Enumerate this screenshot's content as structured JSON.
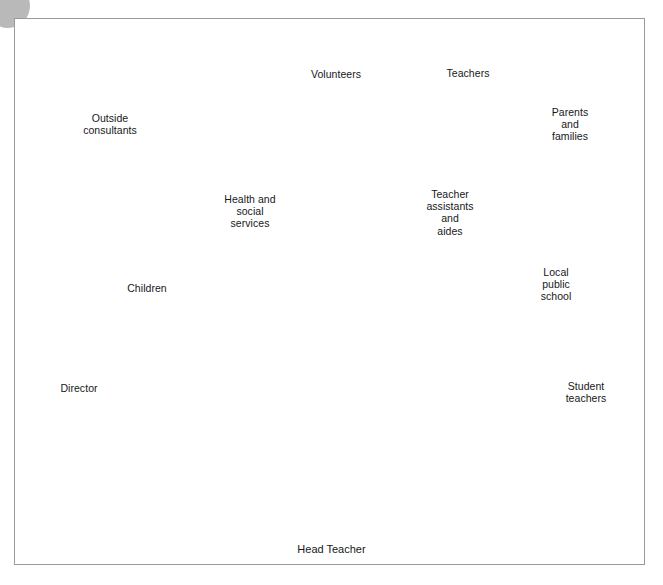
{
  "figure": {
    "type": "radial-balloon-diagram",
    "caption": "Head Teacher",
    "center_label": "Head Teacher",
    "center_icon": "head-teacher-portrait",
    "colors": {
      "balloon_fill": "#8a8a8a",
      "balloon_outline": "#4d4d4d",
      "balloon_highlight": "#e6e6e6",
      "string": "#8d8d8d",
      "frame_border": "#9a9a9a",
      "background": "#ffffff",
      "text": "#16181a",
      "corner_marker": "#b9b9b9",
      "skin": "#d4d4d4",
      "hair": "#1a1a1a"
    },
    "corner_marker": "page-corner-circle"
  },
  "balloons": [
    {
      "id": "outside-consultants",
      "label": "Outside\nconsultants",
      "cx": 110,
      "cy": 127,
      "rx": 46,
      "ry": 52,
      "rotate": -10,
      "highlight": "left",
      "knot_x": 122,
      "knot_y": 180,
      "label_x": 110,
      "label_y": 124
    },
    {
      "id": "volunteers",
      "label": "Volunteers",
      "cx": 336,
      "cy": 77,
      "rx": 43,
      "ry": 51,
      "rotate": 0,
      "highlight": "left",
      "knot_x": 336,
      "knot_y": 129,
      "label_x": 336,
      "label_y": 74
    },
    {
      "id": "teachers",
      "label": "Teachers",
      "cx": 470,
      "cy": 73,
      "rx": 45,
      "ry": 51,
      "rotate": 8,
      "highlight": "right",
      "knot_x": 452,
      "knot_y": 122,
      "label_x": 468,
      "label_y": 73
    },
    {
      "id": "parents-and-families",
      "label": "Parents\nand\nfamilies",
      "cx": 572,
      "cy": 127,
      "rx": 45,
      "ry": 51,
      "rotate": 10,
      "highlight": "right",
      "knot_x": 556,
      "knot_y": 175,
      "label_x": 570,
      "label_y": 124
    },
    {
      "id": "health-and-social-services",
      "label": "Health and\nsocial\nservices",
      "cx": 251,
      "cy": 213,
      "rx": 44,
      "ry": 50,
      "rotate": -6,
      "highlight": "left",
      "knot_x": 265,
      "knot_y": 262,
      "label_x": 250,
      "label_y": 211
    },
    {
      "id": "teacher-assistants-and-aides",
      "label": "Teacher\nassistants\nand\naides",
      "cx": 452,
      "cy": 212,
      "rx": 44,
      "ry": 50,
      "rotate": 6,
      "highlight": "right",
      "knot_x": 437,
      "knot_y": 260,
      "label_x": 450,
      "label_y": 212
    },
    {
      "id": "children",
      "label": "Children",
      "cx": 146,
      "cy": 291,
      "rx": 47,
      "ry": 50,
      "rotate": -14,
      "highlight": "left",
      "knot_x": 166,
      "knot_y": 335,
      "label_x": 147,
      "label_y": 288
    },
    {
      "id": "local-public-school",
      "label": "Local\npublic\nschool",
      "cx": 558,
      "cy": 285,
      "rx": 44,
      "ry": 50,
      "rotate": 10,
      "highlight": "right",
      "knot_x": 541,
      "knot_y": 332,
      "label_x": 556,
      "label_y": 284
    },
    {
      "id": "director",
      "label": "Director",
      "cx": 77,
      "cy": 392,
      "rx": 49,
      "ry": 50,
      "rotate": -18,
      "highlight": "left",
      "knot_x": 104,
      "knot_y": 431,
      "label_x": 79,
      "label_y": 388
    },
    {
      "id": "student-teachers",
      "label": "Student\nteachers",
      "cx": 587,
      "cy": 394,
      "rx": 46,
      "ry": 50,
      "rotate": 12,
      "highlight": "right",
      "knot_x": 568,
      "knot_y": 437,
      "label_x": 586,
      "label_y": 392
    }
  ],
  "connectors": [
    {
      "id": "connector-outside-consultants",
      "from": "head-teacher",
      "to": "outside-consultants"
    },
    {
      "id": "connector-volunteers",
      "from": "head-teacher",
      "to": "volunteers"
    },
    {
      "id": "connector-teachers",
      "from": "head-teacher",
      "to": "teachers"
    },
    {
      "id": "connector-parents-and-families",
      "from": "head-teacher",
      "to": "parents-and-families"
    },
    {
      "id": "connector-health-and-social-services",
      "from": "head-teacher",
      "to": "health-and-social-services"
    },
    {
      "id": "connector-teacher-assistants-and-aides",
      "from": "head-teacher",
      "to": "teacher-assistants-and-aides"
    },
    {
      "id": "connector-children",
      "from": "head-teacher",
      "to": "children"
    },
    {
      "id": "connector-local-public-school",
      "from": "head-teacher",
      "to": "local-public-school"
    },
    {
      "id": "connector-director",
      "from": "head-teacher",
      "to": "director"
    },
    {
      "id": "connector-student-teachers",
      "from": "head-teacher",
      "to": "student-teachers"
    }
  ]
}
